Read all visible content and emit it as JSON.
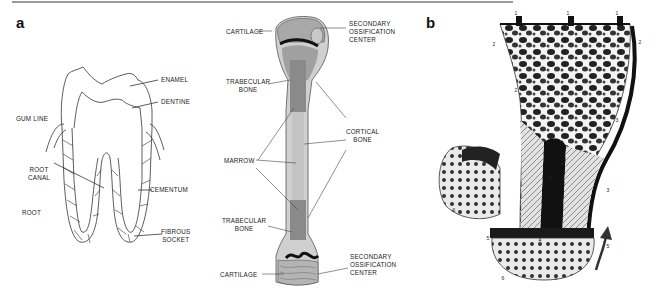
{
  "figure": {
    "panels": [
      {
        "id": "a",
        "letter": "a"
      },
      {
        "id": "b",
        "letter": "b"
      }
    ]
  },
  "tooth": {
    "labels": {
      "enamel": "ENAMEL",
      "dentine": "DENTINE",
      "gum_line": "GUM LINE",
      "root_canal": "ROOT\nCANAL",
      "cementum": "CEMENTUM",
      "root": "ROOT",
      "fibrous_socket": "FIBROUS\nSOCKET"
    }
  },
  "long_bone": {
    "labels": {
      "cartilage_top": "CARTILAGE",
      "secondary_ossification_top": "SECONDARY\nOSSIFICATION\nCENTER",
      "trabecular_top": "TRABECULAR\nBONE",
      "cortical": "CORTICAL\nBONE",
      "marrow": "MARROW",
      "trabecular_bottom": "TRABECULAR\nBONE",
      "cartilage_bottom": "CARTILAGE",
      "secondary_ossification_bottom": "SECONDARY\nOSSIFICATION\nCENTER"
    },
    "colors": {
      "cartilage": "#b8b8b8",
      "trabecular": "#8a8a8a",
      "marrow": "#c4c4c4",
      "cortical": "#d6d6d6",
      "growth_plate": "#111111"
    }
  },
  "bone_section": {
    "markers": [
      "1",
      "1",
      "1",
      "2",
      "2",
      "2",
      "3",
      "3",
      "4",
      "4",
      "4",
      "5",
      "5",
      "6",
      "6",
      "6",
      "7"
    ]
  }
}
